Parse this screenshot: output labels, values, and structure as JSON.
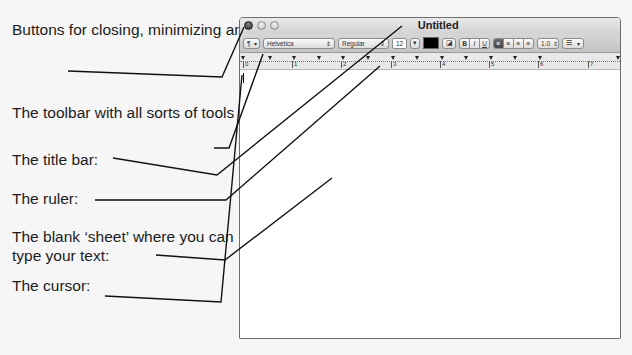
{
  "callouts": [
    {
      "id": "window-buttons",
      "text": "Buttons for closing, minimizing and maximizing the program:"
    },
    {
      "id": "toolbar",
      "text": "The toolbar with all sorts of tools for formatting the text:"
    },
    {
      "id": "title-bar",
      "text": "The title bar:"
    },
    {
      "id": "ruler",
      "text": "The ruler:"
    },
    {
      "id": "sheet",
      "text": "The blank ‘sheet’ where you can type your text:"
    },
    {
      "id": "cursor",
      "text": "The cursor:"
    }
  ],
  "window": {
    "title": "Untitled",
    "buttons": [
      "close",
      "minimize",
      "maximize"
    ]
  },
  "toolbar": {
    "paragraph_style": "¶",
    "font_family": "Helvetica",
    "typeface": "Regular",
    "font_size": "12",
    "text_color": "#000000",
    "bold": "B",
    "italic": "I",
    "underline": "U",
    "alignment": [
      "left",
      "center",
      "right",
      "justify"
    ],
    "active_alignment": "left",
    "line_spacing": "1.0",
    "list_style": "☰"
  },
  "ruler": {
    "numbers": [
      "0",
      "1",
      "2",
      "3",
      "4",
      "5",
      "6",
      "7"
    ]
  }
}
